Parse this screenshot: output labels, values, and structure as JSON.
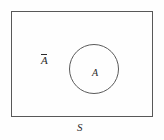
{
  "diagram": {
    "kind": "venn-diagram",
    "universe": {
      "label": "S",
      "shape": "rectangle",
      "stroke_color": "#585858"
    },
    "set": {
      "label": "A",
      "shape": "circle",
      "stroke_color": "#5a5a5a"
    },
    "complement": {
      "label": "A",
      "overbar": true,
      "text": "Ā"
    },
    "background_color": "#fefefe",
    "text_color": "#2b2b2b"
  }
}
